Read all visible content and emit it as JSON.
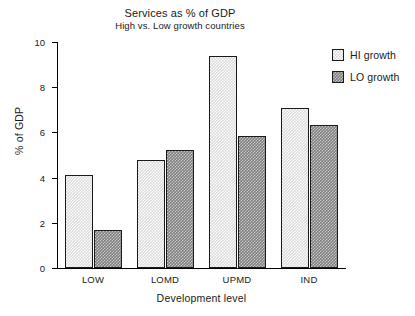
{
  "chart_data": {
    "type": "bar",
    "title": "Services as % of GDP",
    "subtitle": "High vs. Low growth countries",
    "xlabel": "Development level",
    "ylabel": "% of GDP",
    "ylim": [
      0,
      10
    ],
    "yticks": [
      0,
      2,
      4,
      6,
      8,
      10
    ],
    "ytick_labels": [
      "0",
      "2",
      "4",
      "6",
      "8",
      "10"
    ],
    "grid": false,
    "legend_position": "right",
    "categories": [
      "LOW",
      "LOMD",
      "UPMD",
      "IND"
    ],
    "series": [
      {
        "name": "HI growth",
        "color": "#dcdcdc",
        "values": [
          4.1,
          4.8,
          9.4,
          7.1
        ]
      },
      {
        "name": "LO growth",
        "color": "#7e7e7e",
        "values": [
          1.7,
          5.2,
          5.85,
          6.35
        ]
      }
    ]
  }
}
